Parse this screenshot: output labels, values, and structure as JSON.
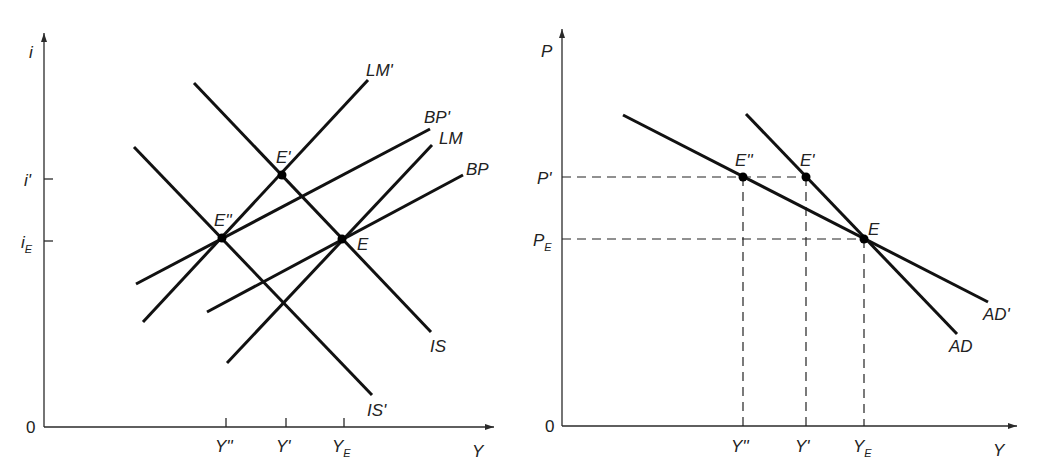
{
  "left_panel": {
    "axes": {
      "y_label": "i",
      "x_label": "Y",
      "origin": "0"
    },
    "y_ticks": [
      {
        "label": "i'",
        "sub": ""
      },
      {
        "label": "i",
        "sub": "E"
      }
    ],
    "x_ticks": [
      {
        "label": "Y''",
        "sub": ""
      },
      {
        "label": "Y'",
        "sub": ""
      },
      {
        "label": "Y",
        "sub": "E"
      }
    ],
    "curves": {
      "lm_prime": "LM'",
      "bp_prime": "BP'",
      "lm": "LM",
      "bp": "BP",
      "is": "IS",
      "is_prime": "IS'"
    },
    "points": {
      "e_prime": "E'",
      "e_double_prime": "E''",
      "e": "E"
    }
  },
  "right_panel": {
    "axes": {
      "y_label": "P",
      "x_label": "Y",
      "origin": "0"
    },
    "y_ticks": [
      {
        "label": "P'",
        "sub": ""
      },
      {
        "label": "P",
        "sub": "E"
      }
    ],
    "x_ticks": [
      {
        "label": "Y''",
        "sub": ""
      },
      {
        "label": "Y'",
        "sub": ""
      },
      {
        "label": "Y",
        "sub": "E"
      }
    ],
    "curves": {
      "ad": "AD",
      "ad_prime": "AD'"
    },
    "points": {
      "e_double_prime": "E''",
      "e_prime": "E'",
      "e": "E"
    }
  },
  "colors": {
    "ink": "#111111",
    "background": "#ffffff"
  }
}
